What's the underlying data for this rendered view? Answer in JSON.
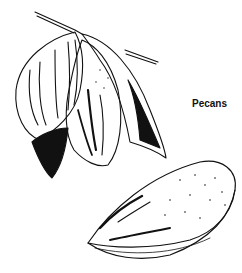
{
  "illustration": {
    "subject": "pecans",
    "style": "black-and-white line drawing",
    "label": "Pecans",
    "elements": [
      "twig",
      "husk-with-two-nuts",
      "single-pecan-nut"
    ]
  },
  "colors": {
    "ink": "#111111",
    "paper": "#ffffff"
  }
}
